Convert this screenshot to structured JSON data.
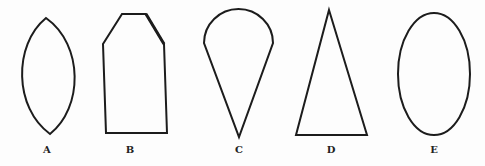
{
  "figure": {
    "stroke_color": "#1c1c1c",
    "background_color": "#fdfdfd",
    "shapes": [
      {
        "id": "A",
        "label": "A",
        "type": "vesica / pointed oval (lens)"
      },
      {
        "id": "B",
        "label": "B",
        "type": "pentagon-like house shape with chamfered top corners"
      },
      {
        "id": "C",
        "label": "C",
        "type": "teardrop / ice-cream cone (semicircle atop inverted triangle)"
      },
      {
        "id": "D",
        "label": "D",
        "type": "tall isosceles triangle"
      },
      {
        "id": "E",
        "label": "E",
        "type": "vertical ellipse"
      }
    ]
  }
}
